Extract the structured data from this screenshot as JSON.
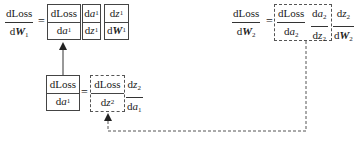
{
  "diagram": {
    "top_left_equation": {
      "lhs": {
        "num": "dLoss",
        "den_prefix": "d",
        "den_var": "W",
        "den_sub": "1"
      },
      "equals": "=",
      "terms": [
        {
          "num_text": "dLoss",
          "den_prefix": "d",
          "den_var": "a",
          "den_sub": "1",
          "border": "solid"
        },
        {
          "num_prefix": "d",
          "num_var": "a",
          "num_sub": "1",
          "den_prefix": "d",
          "den_var": "z",
          "den_sub": "1",
          "border": "solid"
        },
        {
          "num_prefix": "d",
          "num_var": "z",
          "num_sub": "1",
          "den_prefix": "d",
          "den_var": "W",
          "den_sub": "1",
          "border": "solid"
        }
      ]
    },
    "top_right_equation": {
      "lhs": {
        "num": "dLoss",
        "den_prefix": "d",
        "den_var": "W",
        "den_sub": "2"
      },
      "equals": "=",
      "grouped": {
        "border": "dashed",
        "t1": {
          "num": "dLoss",
          "den_prefix": "d",
          "den_var": "a",
          "den_sub": "2"
        },
        "t2": {
          "num_prefix": "d",
          "num_var": "a",
          "num_sub": "2",
          "den_prefix": "d",
          "den_var": "z",
          "den_sub": "2"
        }
      },
      "tail": {
        "num_prefix": "d",
        "num_var": "z",
        "num_sub": "2",
        "den_prefix": "d",
        "den_var": "W",
        "den_sub": "2"
      }
    },
    "middle_equation": {
      "lhs": {
        "num": "dLoss",
        "den_prefix": "d",
        "den_var": "a",
        "den_sub": "1",
        "border": "solid"
      },
      "equals": "=",
      "grouped": {
        "num": "dLoss",
        "den_prefix": "d",
        "den_var": "z",
        "den_sub": "2",
        "border": "dashed"
      },
      "tail": {
        "num_prefix": "d",
        "num_var": "z",
        "num_sub": "2",
        "den_prefix": "d",
        "den_var": "a",
        "den_sub": "1"
      }
    },
    "arrows": [
      {
        "from": "middle_equation.lhs",
        "to": "top_left_equation.terms.0",
        "style": "solid"
      },
      {
        "from": "top_right_equation.grouped",
        "to": "middle_equation.grouped",
        "style": "dashed"
      }
    ]
  }
}
